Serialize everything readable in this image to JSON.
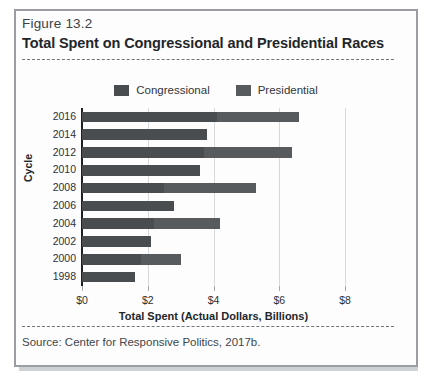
{
  "figure": {
    "label": "Figure 13.2",
    "title": "Total Spent on Congressional and Presidential Races",
    "source": "Source: Center for Responsive Politics, 2017b."
  },
  "legend": [
    {
      "label": "Congressional",
      "color": "#4a4d50",
      "icon": "legend-swatch-congressional"
    },
    {
      "label": "Presidential",
      "color": "#585b5e",
      "icon": "legend-swatch-presidential"
    }
  ],
  "chart_data": {
    "type": "bar",
    "orientation": "horizontal",
    "stacked": true,
    "title": "Total Spent on Congressional and Presidential Races",
    "xlabel": "Total Spent (Actual Dollars, Billions)",
    "ylabel": "Cycle",
    "xlim": [
      0,
      8
    ],
    "xticks": [
      0,
      2,
      4,
      6,
      8
    ],
    "xticklabels": [
      "$0",
      "$2",
      "$4",
      "$6",
      "$8"
    ],
    "grid": "vertical",
    "legend_position": "top-center",
    "categories": [
      "2016",
      "2014",
      "2012",
      "2010",
      "2008",
      "2006",
      "2004",
      "2002",
      "2000",
      "1998"
    ],
    "series": [
      {
        "name": "Congressional",
        "color": "#4a4d50",
        "values": [
          4.1,
          3.8,
          3.7,
          3.6,
          2.5,
          2.8,
          2.2,
          2.1,
          1.8,
          1.6
        ]
      },
      {
        "name": "Presidential",
        "color": "#585b5e",
        "values": [
          2.5,
          0.0,
          2.7,
          0.0,
          2.8,
          0.0,
          2.0,
          0.0,
          1.2,
          0.0
        ]
      }
    ],
    "totals": [
      6.6,
      3.8,
      6.4,
      3.6,
      5.3,
      2.8,
      4.2,
      2.1,
      3.0,
      1.6
    ]
  }
}
